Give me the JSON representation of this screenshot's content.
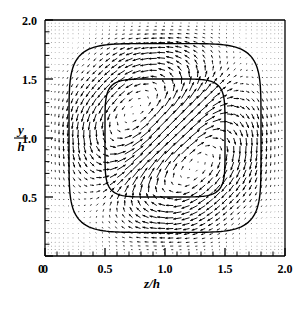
{
  "figure": {
    "name": "secondary-flow-vector-field",
    "background_color": "#ffffff",
    "ink_color": "#000000"
  },
  "axes": {
    "x": {
      "title_numerator": "z",
      "title_denominator": "h",
      "title_plain": "z/h",
      "tick_labels": [
        "0",
        "0.5",
        "1.0",
        "1.5",
        "2.0"
      ],
      "tick_values": [
        0,
        0.5,
        1.0,
        1.5,
        2.0
      ],
      "minor_ticks_per_interval": 4,
      "range": [
        0,
        2.0
      ]
    },
    "y": {
      "title_numerator": "y",
      "title_denominator": "h",
      "title_plain": "y/h",
      "tick_labels": [
        "0",
        "0.5",
        "1.0",
        "1.5",
        "2.0"
      ],
      "tick_values": [
        0,
        0.5,
        1.0,
        1.5,
        2.0
      ],
      "minor_ticks_per_interval": 4,
      "range": [
        0,
        2.0
      ]
    }
  },
  "chart_data": {
    "type": "scatter",
    "plot_kind": "quiver-vector-field",
    "title": "",
    "subtitle": "",
    "xlabel": "z/h",
    "ylabel": "y/h",
    "xlim": [
      0,
      2.0
    ],
    "ylim": [
      0,
      2.0
    ],
    "grid": false,
    "legend": null,
    "legend_position": "none",
    "x_tick_labels": [
      "0",
      "0.5",
      "1.0",
      "1.5",
      "2.0"
    ],
    "y_tick_labels": [
      "0",
      "0.5",
      "1.0",
      "1.5",
      "2.0"
    ],
    "x_ticks": [
      0,
      0.5,
      1.0,
      1.5,
      2.0
    ],
    "y_ticks": [
      0,
      0.5,
      1.0,
      1.5,
      2.0
    ],
    "vector_field": {
      "grid_nodes_x": 40,
      "grid_nodes_y": 40,
      "grid_stretching": "wall-clustered (hyperbolic tangent), fine near walls, coarse at centre",
      "stretch_beta": 2.2,
      "arrow_scale": 0.085,
      "max_vector_magnitude_fraction_of_bulk": 0.02,
      "symmetry": "eight-fold (two vortices per wall, mirror symmetric about both centrelines and both diagonals)",
      "vortex_count": 8,
      "vortex_centers": [
        {
          "z": 0.45,
          "y": 1.62
        },
        {
          "z": 1.55,
          "y": 1.62
        },
        {
          "z": 0.38,
          "y": 1.55
        },
        {
          "z": 1.62,
          "y": 1.55
        },
        {
          "z": 0.38,
          "y": 0.45
        },
        {
          "z": 1.62,
          "y": 0.45
        },
        {
          "z": 0.45,
          "y": 0.38
        },
        {
          "z": 1.55,
          "y": 0.38
        }
      ],
      "stagnation_points": [
        {
          "z": 1.0,
          "y": 2.0
        },
        {
          "z": 1.0,
          "y": 0.0
        },
        {
          "z": 0.0,
          "y": 1.0
        },
        {
          "z": 2.0,
          "y": 1.0
        },
        {
          "z": 1.0,
          "y": 1.0
        }
      ],
      "near_wall_max_speed_region": "corner bisectors",
      "centre_speed": "near zero"
    },
    "contours": [
      {
        "label": "outer isoline",
        "shape": "rounded-square",
        "half_width": 0.8,
        "corner_roundness": 0.42,
        "center": {
          "z": 1.0,
          "y": 1.0
        },
        "line_width_px": 1.4
      },
      {
        "label": "inner isoline",
        "shape": "rounded-square",
        "half_width": 0.5,
        "corner_roundness": 0.48,
        "center": {
          "z": 1.0,
          "y": 1.0
        },
        "line_width_px": 1.4
      }
    ]
  }
}
